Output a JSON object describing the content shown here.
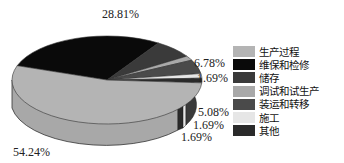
{
  "chart_data": {
    "type": "pie",
    "style": "3d",
    "title": "",
    "categories": [
      "生产过程",
      "维保和检修",
      "储存",
      "调试和试生产",
      "装运和转移",
      "施工",
      "其他"
    ],
    "values": [
      54.24,
      28.81,
      6.78,
      1.69,
      5.08,
      1.69,
      1.69
    ],
    "value_labels": [
      "54.24%",
      "28.81%",
      "6.78%",
      "1.69%",
      "5.08%",
      "1.69%",
      "1.69%"
    ],
    "colors": [
      "#b4b4b4",
      "#0a0a0a",
      "#3a3a3a",
      "#a9a9a9",
      "#4a4a4a",
      "#e6e6e6",
      "#2a2a2a"
    ],
    "legend_position": "right"
  },
  "labels": {
    "l0": "54.24%",
    "l1": "28.81%",
    "l2": "6.78%",
    "l3": "1.69%",
    "l4": "5.08%",
    "l5": "1.69%",
    "l6": "1.69%"
  },
  "legend": [
    {
      "label": "生产过程",
      "color": "#b4b4b4"
    },
    {
      "label": "维保和检修",
      "color": "#0a0a0a"
    },
    {
      "label": "储存",
      "color": "#3a3a3a"
    },
    {
      "label": "调试和试生产",
      "color": "#a9a9a9"
    },
    {
      "label": "装运和转移",
      "color": "#4a4a4a"
    },
    {
      "label": "施工",
      "color": "#e6e6e6"
    },
    {
      "label": "其他",
      "color": "#2a2a2a"
    }
  ]
}
